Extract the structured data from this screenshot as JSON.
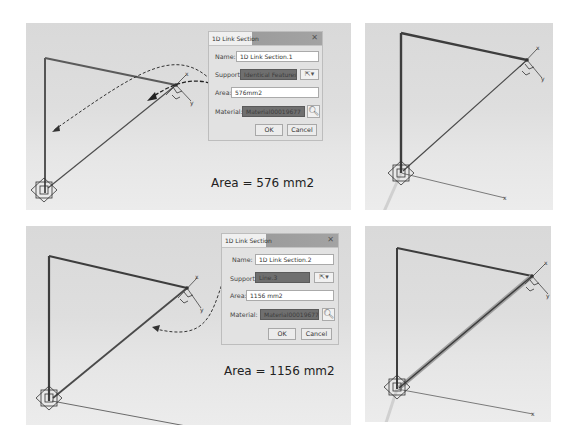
{
  "panels": {
    "top_left": {
      "dialog": {
        "title": "1D Link Section",
        "close_label": "✕",
        "name_label": "Name:",
        "name_value": "1D Link Section.1",
        "support_label": "Support:",
        "support_value": "Identical Features",
        "area_label": "Area:",
        "area_value": "576mm2",
        "material_label": "Material:",
        "material_value": "Material00019677",
        "ok_label": "OK",
        "cancel_label": "Cancel",
        "selector_icon": "cursor-select-icon",
        "dropdown_icon": "▾",
        "search_icon": "magnifier-icon"
      },
      "caption": "Area = 576 mm2",
      "axis_labels": {
        "x": "x",
        "y": "y"
      }
    },
    "top_right": {
      "axis_labels": {
        "x": "x",
        "y": "y"
      }
    },
    "bottom_left": {
      "dialog": {
        "title": "1D Link Section",
        "close_label": "✕",
        "name_label": "Name:",
        "name_value": "1D Link Section.2",
        "support_label": "Support:",
        "support_value": "Line.3",
        "area_label": "Area:",
        "area_value": "1156 mm2",
        "material_label": "Material:",
        "material_value": "Material00019677",
        "ok_label": "OK",
        "cancel_label": "Cancel",
        "selector_icon": "cursor-select-icon",
        "dropdown_icon": "▾",
        "search_icon": "magnifier-icon"
      },
      "caption": "Area = 1156 mm2",
      "axis_labels": {
        "x": "x",
        "y": "y"
      }
    },
    "bottom_right": {
      "axis_labels": {
        "x": "x",
        "y": "y"
      }
    }
  },
  "colors": {
    "viewport_bg": "#dedede",
    "frame_line": "#4a4a4a",
    "diag_line": "#5a5a5a",
    "dialog_bg": "#e2e2e2",
    "dark_field": "#6f6f6f"
  }
}
